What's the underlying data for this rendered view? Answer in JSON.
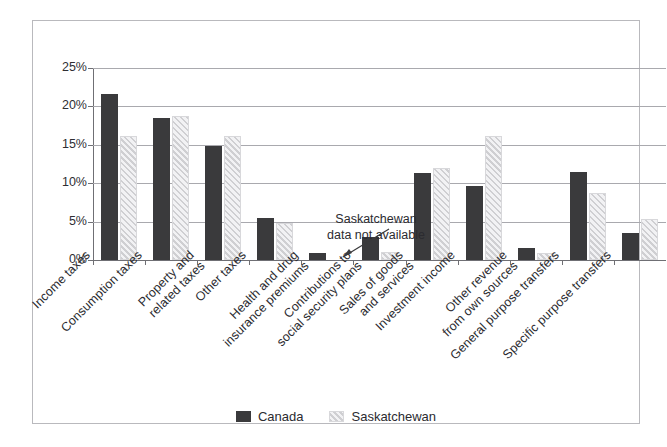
{
  "chart_data": {
    "type": "bar",
    "title": "",
    "xlabel": "",
    "ylabel": "",
    "ylim": [
      0,
      25
    ],
    "ytick_labels": [
      "0%",
      "5%",
      "10%",
      "15%",
      "20%",
      "25%"
    ],
    "ytick_values": [
      0,
      5,
      10,
      15,
      20,
      25
    ],
    "grid": true,
    "legend_position": "bottom-center",
    "categories": [
      "Income taxes",
      "Consumption taxes",
      "Property and\nrelated taxes",
      "Other taxes",
      "Health and drug\ninsurance premiums",
      "Contributions to\nsocial security plans",
      "Sales of goods\nand services",
      "Investment income",
      "Other revenue\nfrom own sources",
      "General purpose transfers",
      "Specific purpose transfers"
    ],
    "series": [
      {
        "name": "Canada",
        "color": "#3a3a3c",
        "values": [
          21.6,
          18.5,
          14.8,
          5.5,
          0.9,
          3.0,
          11.3,
          9.6,
          1.5,
          11.4,
          3.5
        ]
      },
      {
        "name": "Saskatchewan",
        "color": "#cfcfd2",
        "values": [
          16.2,
          18.8,
          16.1,
          4.8,
          null,
          1.0,
          12.0,
          16.2,
          0.9,
          8.7,
          5.4
        ]
      }
    ],
    "annotations": [
      {
        "text": "Saskatchewan\ndata not available",
        "points_to_category": "Health and drug\ninsurance premiums",
        "points_to_series": "Saskatchewan"
      }
    ]
  },
  "legend": {
    "items": [
      {
        "label": "Canada",
        "swatch": "solid-dark-square"
      },
      {
        "label": "Saskatchewan",
        "swatch": "hatched-light-square"
      }
    ]
  },
  "annotation": {
    "line1": "Saskatchewan",
    "line2": "data not available"
  },
  "axis": {
    "y_ticks": [
      "25%",
      "20%",
      "15%",
      "10%",
      "5%",
      "0%"
    ]
  }
}
